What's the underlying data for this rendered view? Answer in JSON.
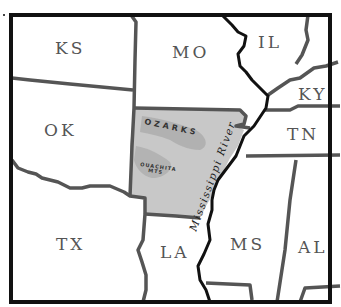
{
  "map": {
    "highlighted_state": "Arkansas",
    "colors": {
      "highlight_fill": "#c8c8c8",
      "mountain_shade": "#a9a9a9",
      "border": "#555555",
      "river": "#111111",
      "frame": "#111111",
      "background": "#ffffff"
    },
    "states": [
      {
        "abbr": "KS"
      },
      {
        "abbr": "MO"
      },
      {
        "abbr": "IL"
      },
      {
        "abbr": "KY"
      },
      {
        "abbr": "OK"
      },
      {
        "abbr": "TN"
      },
      {
        "abbr": "TX"
      },
      {
        "abbr": "LA"
      },
      {
        "abbr": "MS"
      },
      {
        "abbr": "AL"
      }
    ],
    "features": {
      "ozarks": "OZARKS",
      "ouachita_line1": "OUACHITA",
      "ouachita_line2": "MTS",
      "river": "Mississippi River"
    }
  }
}
